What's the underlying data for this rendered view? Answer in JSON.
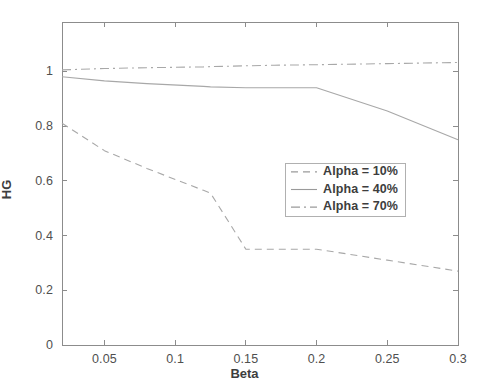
{
  "chart_data": {
    "type": "line",
    "title": "",
    "xlabel": "Beta",
    "ylabel": "HG",
    "xlim": [
      0.02,
      0.3
    ],
    "ylim": [
      0,
      1.18
    ],
    "xticks": [
      "0.05",
      "0.1",
      "0.15",
      "0.2",
      "0.25",
      "0.3"
    ],
    "xtick_values": [
      0.05,
      0.1,
      0.15,
      0.2,
      0.25,
      0.3
    ],
    "yticks": [
      "0",
      "0.2",
      "0.4",
      "0.6",
      "0.8",
      "1"
    ],
    "ytick_values": [
      0,
      0.2,
      0.4,
      0.6,
      0.8,
      1
    ],
    "grid": false,
    "legend_position": "center-right",
    "x": [
      0.02,
      0.05,
      0.08,
      0.12,
      0.125,
      0.15,
      0.17,
      0.2,
      0.25,
      0.3
    ],
    "series": [
      {
        "name": "Alpha = 10%",
        "style": "dashed",
        "values": [
          0.81,
          0.71,
          0.645,
          0.565,
          0.555,
          0.35,
          0.35,
          0.35,
          0.31,
          0.27
        ]
      },
      {
        "name": "Alpha = 40%",
        "style": "solid",
        "values": [
          0.98,
          0.965,
          0.955,
          0.945,
          0.943,
          0.94,
          0.94,
          0.94,
          0.855,
          0.75
        ]
      },
      {
        "name": "Alpha = 70%",
        "style": "dashdot",
        "values": [
          1.005,
          1.01,
          1.013,
          1.016,
          1.017,
          1.02,
          1.022,
          1.024,
          1.028,
          1.032
        ]
      }
    ]
  },
  "legend": {
    "entries": [
      {
        "label": "Alpha = 10%"
      },
      {
        "label": "Alpha = 40%"
      },
      {
        "label": "Alpha = 70%"
      }
    ]
  },
  "colors": {
    "axis": "#8c8c8c",
    "series": "#a8a8a8",
    "text": "#4f4f4f",
    "background": "#ffffff"
  }
}
